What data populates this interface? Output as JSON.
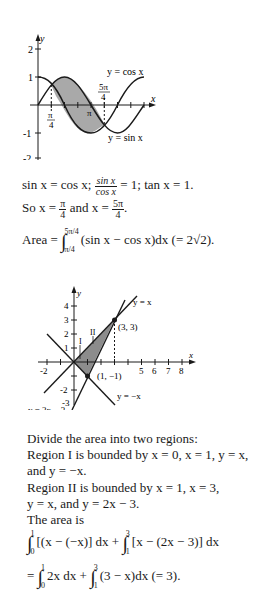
{
  "graph1": {
    "axis_x_label": "x",
    "axis_y_label": "y",
    "y_ticks": [
      "2",
      "1",
      "-1",
      "-2"
    ],
    "x_tick_labels": {
      "pi_over_4_num": "π",
      "pi_over_4_den": "4",
      "pi": "π",
      "five_pi_over_4_num": "5π",
      "five_pi_over_4_den": "4"
    },
    "curve_labels": {
      "cos": "y = cos x",
      "sin": "y = sin x"
    },
    "colors": {
      "shade": "#a9a9a9",
      "line": "#1a1a1a"
    }
  },
  "text1": {
    "line1_a": "sin x = cos x; ",
    "line1_frac_num": "sin x",
    "line1_frac_den": "cos x",
    "line1_b": " = 1; tan x = 1.",
    "line2_a": "So x = ",
    "line2_frac1_num": "π",
    "line2_frac1_den": "4",
    "line2_b": " and x = ",
    "line2_frac2_num": "5π",
    "line2_frac2_den": "4",
    "line2_c": ".",
    "area_label": "Area = ",
    "area_upper": "5π/4",
    "area_lower": "π/4",
    "area_integrand": "(sin x − cos x)dx (= 2√2)."
  },
  "graph2": {
    "axis_x_label": "x",
    "axis_y_label": "y",
    "y_ticks": [
      "4",
      "3",
      "2",
      "1",
      "-2",
      "-3"
    ],
    "x_ticks": [
      "-2",
      "5",
      "6",
      "7",
      "8"
    ],
    "region_labels": [
      "I",
      "II"
    ],
    "points": [
      {
        "label": "(3, 3)",
        "x": 3,
        "y": 3
      },
      {
        "label": "(1, −1)",
        "x": 1,
        "y": -1
      }
    ],
    "line_labels": {
      "y_eq_x": "y = x",
      "y_eq_neg_x": "y = −x",
      "y_eq_2x_minus_3": "y = 2x − 3"
    },
    "colors": {
      "shade": "#8c8c8c",
      "line": "#1a1a1a"
    }
  },
  "text2": {
    "p1": "Divide the area into two regions:",
    "p2": "Region I is bounded by x = 0, x = 1, y = x,",
    "p3": "and y = −x.",
    "p4": "Region II is bounded by x = 1, x = 3,",
    "p5": "y = x, and y = 2x − 3.",
    "p6": "The area is",
    "int1_upper": "1",
    "int1_lower": "0",
    "int1_body": "[(x − (−x)] dx + ",
    "int2_upper": "3",
    "int2_lower": "1",
    "int2_body": "[x − (2x − 3)] dx",
    "eq_prefix": "= ",
    "int3_upper": "1",
    "int3_lower": "0",
    "int3_body": "2x dx + ",
    "int4_upper": "3",
    "int4_lower": "1",
    "int4_body": "(3 − x)dx (= 3)."
  }
}
